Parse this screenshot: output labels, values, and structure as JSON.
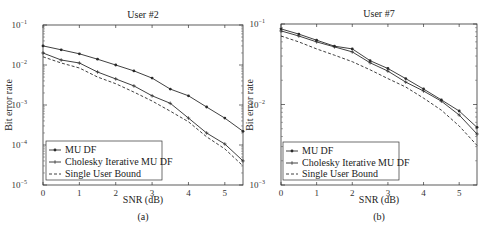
{
  "chart_data": [
    {
      "type": "line",
      "panel": "(a)",
      "title": "User #2",
      "xlabel": "SNR (dB)",
      "ylabel": "Bit error rate",
      "yscale": "log",
      "xlim": [
        0,
        5.5
      ],
      "ylim": [
        1e-05,
        0.1
      ],
      "xticks": [
        "0",
        "1",
        "2",
        "3",
        "4",
        "5"
      ],
      "yticks": [
        "10^-5",
        "10^-4",
        "10^-3",
        "10^-2",
        "10^-1"
      ],
      "legend_position": "lower left",
      "grid": false,
      "x": [
        0,
        0.5,
        1,
        1.5,
        2,
        2.5,
        3,
        3.5,
        4,
        4.5,
        5,
        5.5
      ],
      "series": [
        {
          "name": "MU DF",
          "style": "solid-dot",
          "values": [
            0.03,
            0.024,
            0.019,
            0.014,
            0.01,
            0.0071,
            0.0047,
            0.0025,
            0.0017,
            0.00089,
            0.00047,
            0.00022
          ]
        },
        {
          "name": "Cholesky Iterative MU DF",
          "style": "solid-plus",
          "values": [
            0.02,
            0.0133,
            0.0112,
            0.0067,
            0.0045,
            0.003,
            0.0017,
            0.0011,
            0.00047,
            0.0002,
            0.000106,
            4e-05
          ]
        },
        {
          "name": "Single User Bound",
          "style": "dashed",
          "values": [
            0.016,
            0.0112,
            0.0084,
            0.005,
            0.0034,
            0.0021,
            0.00126,
            0.0007,
            0.00038,
            0.00016,
            8e-05,
            3e-05
          ]
        }
      ]
    },
    {
      "type": "line",
      "panel": "(b)",
      "title": "User #7",
      "xlabel": "SNR (dB)",
      "ylabel": "Bit error rate",
      "yscale": "log",
      "xlim": [
        0,
        5.5
      ],
      "ylim": [
        0.001,
        0.1
      ],
      "xticks": [
        "0",
        "1",
        "2",
        "3",
        "4",
        "5"
      ],
      "yticks": [
        "10^-3",
        "10^-2",
        "10^-1"
      ],
      "legend_position": "lower left",
      "grid": false,
      "x": [
        0,
        0.5,
        1,
        1.5,
        2,
        2.5,
        3,
        3.5,
        4,
        4.5,
        5,
        5.5
      ],
      "series": [
        {
          "name": "MU DF",
          "style": "solid-dot",
          "values": [
            0.087,
            0.075,
            0.063,
            0.053,
            0.049,
            0.035,
            0.028,
            0.021,
            0.0156,
            0.0114,
            0.0083,
            0.0052
          ]
        },
        {
          "name": "Cholesky Iterative MU DF",
          "style": "solid-plus",
          "values": [
            0.082,
            0.071,
            0.06,
            0.052,
            0.045,
            0.033,
            0.026,
            0.019,
            0.0147,
            0.011,
            0.0074,
            0.0043
          ]
        },
        {
          "name": "Single User Bound",
          "style": "dashed",
          "values": [
            0.071,
            0.06,
            0.049,
            0.041,
            0.034,
            0.027,
            0.021,
            0.0165,
            0.012,
            0.0085,
            0.0054,
            0.0031
          ]
        }
      ]
    }
  ],
  "panels": [
    {
      "title": "User #2",
      "xlabel": "SNR (dB)",
      "ylabel": "Bit error rate",
      "caption": "(a)",
      "legend": [
        "MU DF",
        "Cholesky Iterative MU DF",
        "Single User Bound"
      ],
      "xticks": [
        "0",
        "1",
        "2",
        "3",
        "4",
        "5"
      ],
      "yticks": [
        {
          "base": "10",
          "exp": "-1"
        },
        {
          "base": "10",
          "exp": "-2"
        },
        {
          "base": "10",
          "exp": "-3"
        },
        {
          "base": "10",
          "exp": "-4"
        },
        {
          "base": "10",
          "exp": "-5"
        }
      ]
    },
    {
      "title": "User #7",
      "xlabel": "SNR (dB)",
      "ylabel": "Bit error rate",
      "caption": "(b)",
      "legend": [
        "MU DF",
        "Cholesky Iterative MU DF",
        "Single User Bound"
      ],
      "xticks": [
        "0",
        "1",
        "2",
        "3",
        "4",
        "5"
      ],
      "yticks": [
        {
          "base": "10",
          "exp": "-1"
        },
        {
          "base": "10",
          "exp": "-2"
        },
        {
          "base": "10",
          "exp": "-3"
        }
      ]
    }
  ],
  "colors": {
    "line": "#2a2a2a",
    "axis": "#333333",
    "background": "#ffffff"
  }
}
